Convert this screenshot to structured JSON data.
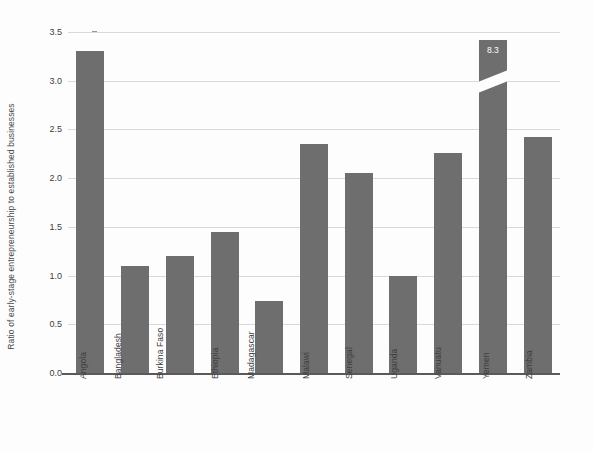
{
  "chart_data": {
    "type": "bar",
    "title": "",
    "xlabel": "",
    "ylabel": "Ratio of early-stage entrepreneurship to established businesses",
    "categories": [
      "Angola",
      "Bangladesh",
      "Burkina Faso",
      "Ethiopia",
      "Madagascar",
      "Malawi",
      "Senegal",
      "Uganda",
      "Vanuatu",
      "Yemen",
      "Zambia"
    ],
    "values": [
      3.31,
      1.1,
      1.2,
      1.45,
      0.74,
      2.35,
      2.05,
      1.0,
      2.26,
      8.3,
      2.42
    ],
    "value_labels": [
      "",
      "",
      "",
      "",
      "",
      "",
      "",
      "",
      "",
      "8.3",
      ""
    ],
    "broken_axis_bars": [
      "Yemen"
    ],
    "ylim": [
      0.0,
      3.5
    ],
    "yticks": [
      0.0,
      0.5,
      1.0,
      1.5,
      2.0,
      2.5,
      3.0,
      3.5
    ],
    "ytick_labels": [
      "0.0",
      "0.5",
      "1.0",
      "1.5",
      "2.0",
      "2.5",
      "3.0",
      "3.5"
    ],
    "grid": true,
    "legend": false,
    "bar_color": "#6e6e6e",
    "grid_color": "#d9d9d9",
    "background_color": "#fdfdfd",
    "axis_color": "#5a5a5a"
  }
}
